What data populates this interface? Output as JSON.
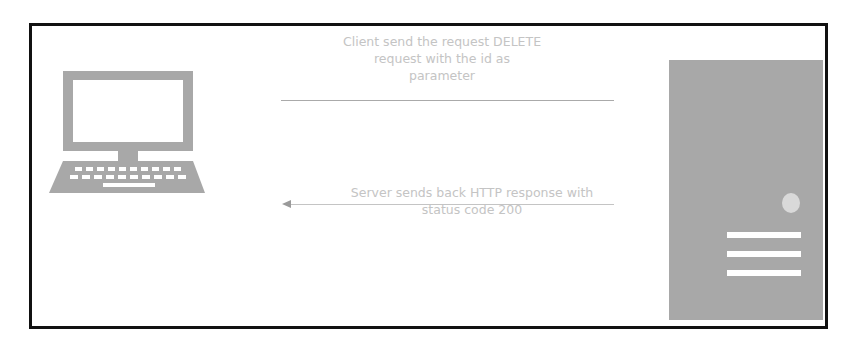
{
  "diagram": {
    "title": "",
    "nodes": {
      "client": {
        "label": "",
        "icon": "desktop-computer-icon",
        "color": "#a8a8a8"
      },
      "server": {
        "label": "",
        "icon": "server-tower-icon",
        "color": "#a8a8a8"
      }
    },
    "edges": [
      {
        "from": "client",
        "to": "server",
        "direction": "right",
        "label": "Client send the request DELETE request with the id as parameter",
        "label_lines": [
          "Client send the request DELETE",
          "request with the id as",
          "parameter"
        ]
      },
      {
        "from": "server",
        "to": "client",
        "direction": "left",
        "label": "Server sends back HTTP response with status code 200",
        "label_lines": [
          "Server sends back HTTP response with",
          "status code 200"
        ]
      }
    ],
    "colors": {
      "frame_border": "#111111",
      "icon_fill": "#a8a8a8",
      "text": "#c4c4c4",
      "line": "#aaaaaa"
    }
  }
}
